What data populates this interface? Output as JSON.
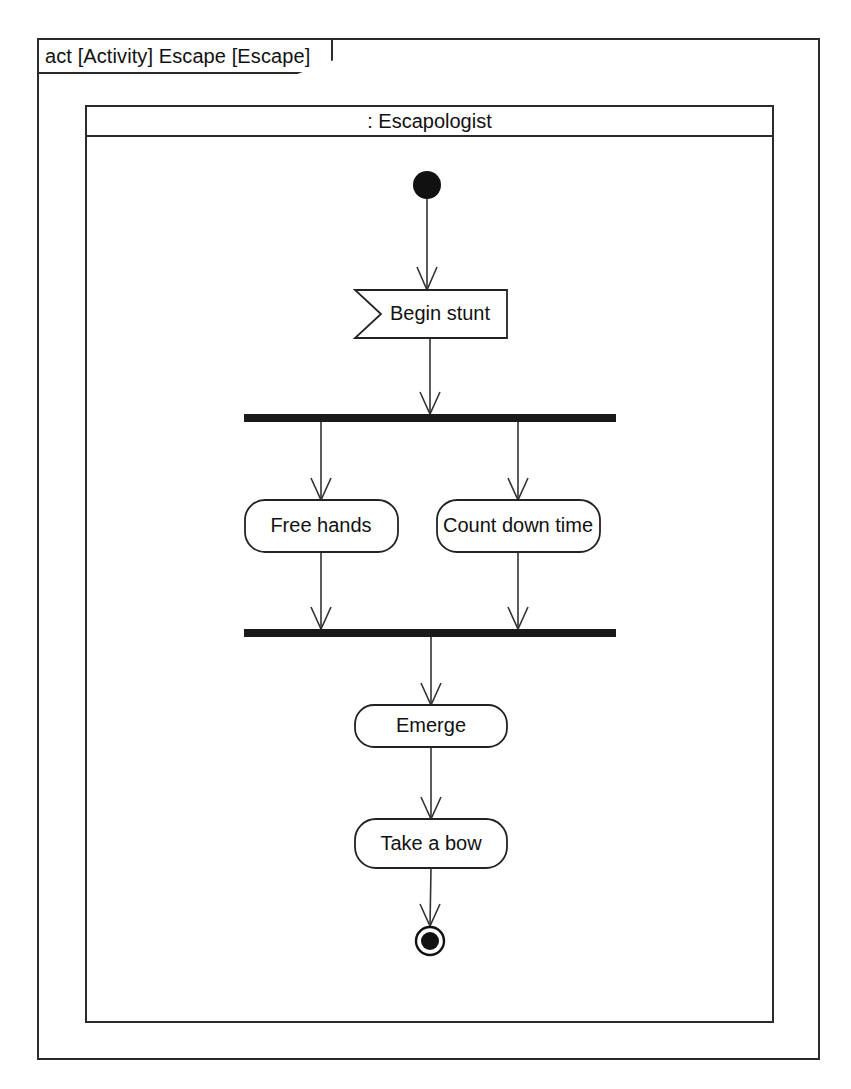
{
  "diagram": {
    "kind": "uml-activity-diagram",
    "frame_label": "act [Activity] Escape [Escape]",
    "partition_label": ": Escapologist",
    "colors": {
      "background": "#ffffff",
      "line": "#333333",
      "shape_stroke": "#222222",
      "bar_fill": "#1a1a1a",
      "text": "#111111"
    },
    "nodes": [
      {
        "id": "initial",
        "type": "initial-node",
        "label": "",
        "cx": 427,
        "cy": 185
      },
      {
        "id": "begin-stunt",
        "type": "accept-event-action",
        "label": "Begin stunt",
        "cx": 431,
        "cy": 314
      },
      {
        "id": "fork",
        "type": "fork-node",
        "label": "",
        "cx": 430,
        "cy": 418
      },
      {
        "id": "free-hands",
        "type": "action",
        "label": "Free hands",
        "cx": 321,
        "cy": 526
      },
      {
        "id": "count-down",
        "type": "action",
        "label": "Count down time",
        "cx": 518,
        "cy": 526
      },
      {
        "id": "join",
        "type": "join-node",
        "label": "",
        "cx": 430,
        "cy": 633
      },
      {
        "id": "emerge",
        "type": "action",
        "label": "Emerge",
        "cx": 431,
        "cy": 726
      },
      {
        "id": "take-a-bow",
        "type": "action",
        "label": "Take a bow",
        "cx": 431,
        "cy": 844
      },
      {
        "id": "final",
        "type": "activity-final-node",
        "label": "",
        "cx": 430,
        "cy": 941
      }
    ],
    "edges": [
      {
        "from": "initial",
        "to": "begin-stunt"
      },
      {
        "from": "begin-stunt",
        "to": "fork"
      },
      {
        "from": "fork",
        "to": "free-hands"
      },
      {
        "from": "fork",
        "to": "count-down"
      },
      {
        "from": "free-hands",
        "to": "join"
      },
      {
        "from": "count-down",
        "to": "join"
      },
      {
        "from": "join",
        "to": "emerge"
      },
      {
        "from": "emerge",
        "to": "take-a-bow"
      },
      {
        "from": "take-a-bow",
        "to": "final"
      }
    ]
  }
}
